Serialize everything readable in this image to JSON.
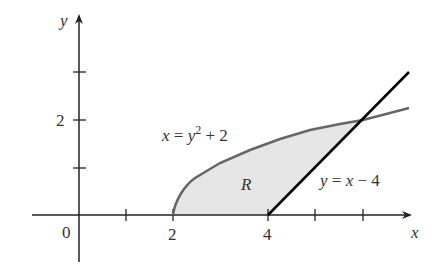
{
  "figure": {
    "axes": {
      "x_label": "x",
      "y_label": "y",
      "origin_label": "0",
      "x_tick_labels": [
        {
          "value": 2,
          "label": "2"
        },
        {
          "value": 4,
          "label": "4"
        }
      ],
      "y_tick_labels": [
        {
          "value": 2,
          "label": "2"
        }
      ],
      "x_ticks": [
        1,
        2,
        3,
        4,
        5,
        6
      ],
      "y_ticks": [
        1,
        2,
        3
      ]
    },
    "curves": [
      {
        "name": "parabola",
        "equation": "x = y² + 2",
        "eq_lhs": "x = y",
        "eq_exp": "2",
        "eq_rhs": " + 2",
        "color": "#666666"
      },
      {
        "name": "line",
        "equation": "y = x − 4",
        "color": "#000000"
      }
    ],
    "region": {
      "label": "R",
      "fill": "#e6e6e6"
    },
    "intersection": {
      "x": 6,
      "y": 2
    }
  }
}
